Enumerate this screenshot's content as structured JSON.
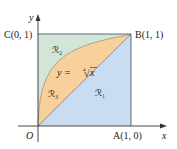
{
  "diagram": {
    "axes": {
      "x_label": "x",
      "y_label": "y",
      "origin_label": "O"
    },
    "points": {
      "A": "A(1, 0)",
      "B": "B(1, 1)",
      "C": "C(0, 1)"
    },
    "regions": {
      "R1": "ℛ₁",
      "R2": "ℛ₂",
      "R3": "ℛ₃"
    },
    "curve_label": "y = ∜√x",
    "curve_label_parts": {
      "lhs": "y = ",
      "root_index": "4",
      "radical": "√",
      "var": "x"
    },
    "colors": {
      "R1": "#c9dcf1",
      "R2": "#d3e5d8",
      "R3": "#f8d09c",
      "axis": "#333333",
      "border": "#4a5a6a"
    }
  }
}
